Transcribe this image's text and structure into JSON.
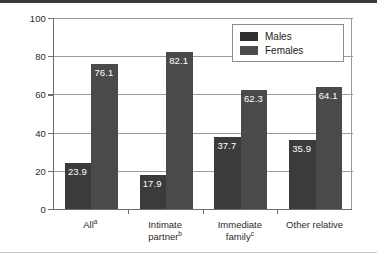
{
  "chart_data": {
    "type": "bar",
    "title": "",
    "xlabel": "",
    "ylabel": "Percentage",
    "ylim": [
      0,
      100
    ],
    "yticks": [
      0,
      20,
      40,
      60,
      80,
      100
    ],
    "ytick_labels": [
      "0",
      "20",
      "40",
      "60",
      "80",
      "100"
    ],
    "grid": true,
    "legend_position": "top-right",
    "categories": [
      {
        "label": "All",
        "sup": "a",
        "line2": "",
        "line2_sup": ""
      },
      {
        "label": "Intimate",
        "sup": "",
        "line2": "partner",
        "line2_sup": "b"
      },
      {
        "label": "Immediate",
        "sup": "",
        "line2": "family",
        "line2_sup": "c"
      },
      {
        "label": "Other relative",
        "sup": "",
        "line2": "",
        "line2_sup": ""
      }
    ],
    "series": [
      {
        "name": "Males",
        "color": "#3b3b3b",
        "values": [
          23.9,
          17.9,
          37.7,
          35.9
        ],
        "value_labels": [
          "23.9",
          "17.9",
          "37.7",
          "35.9"
        ]
      },
      {
        "name": "Females",
        "color": "#4a4a4a",
        "values": [
          76.1,
          82.1,
          62.3,
          64.1
        ],
        "value_labels": [
          "76.1",
          "82.1",
          "62.3",
          "64.1"
        ]
      }
    ]
  },
  "legend": {
    "items": [
      {
        "label": "Males",
        "swatch": "male"
      },
      {
        "label": "Females",
        "swatch": "female"
      }
    ]
  },
  "axis": {
    "y_label": "Percentage"
  }
}
